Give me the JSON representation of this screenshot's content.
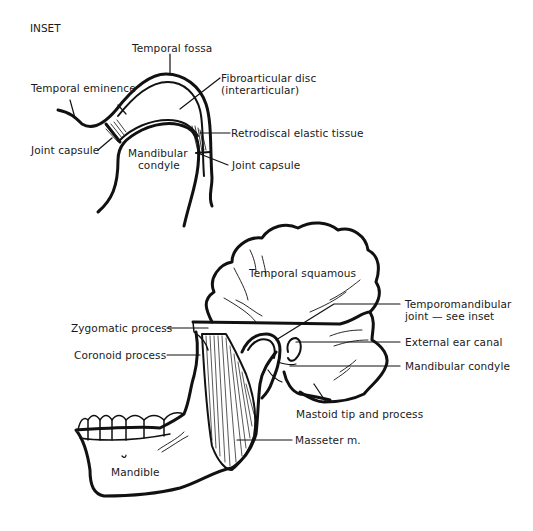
{
  "figure": {
    "type": "anatomical-diagram"
  },
  "inset": {
    "title": "INSET",
    "labels": {
      "temporal_fossa": "Temporal fossa",
      "temporal_eminence": "Temporal eminence",
      "fibroarticular_disc_line1": "Fibroarticular disc",
      "fibroarticular_disc_line2": "(interarticular)",
      "retrodiscal_tissue": "Retrodiscal elastic tissue",
      "joint_capsule_left": "Joint capsule",
      "joint_capsule_right": "Joint capsule",
      "mandibular_condyle_line1": "Mandibular",
      "mandibular_condyle_line2": "condyle"
    }
  },
  "main": {
    "labels": {
      "temporal_squamous": "Temporal squamous",
      "tmj_line1": "Temporomandibular",
      "tmj_line2": "joint — see inset",
      "external_ear_canal": "External ear canal",
      "mandibular_condyle": "Mandibular condyle",
      "mastoid": "Mastoid tip and process",
      "masseter": "Masseter m.",
      "zygomatic_process": "Zygomatic process",
      "coronoid_process": "Coronoid process",
      "mandible": "Mandible"
    }
  },
  "colors": {
    "ink": "#111111",
    "background": "#ffffff"
  }
}
